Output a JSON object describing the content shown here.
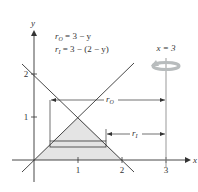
{
  "diagram": {
    "type": "solid-of-revolution",
    "axes": {
      "x_label": "x",
      "y_label": "y",
      "x_ticks": [
        "1",
        "2",
        "3"
      ],
      "y_ticks": [
        "1",
        "2"
      ]
    },
    "equations": {
      "outer": {
        "var": "r",
        "sub": "O",
        "rhs": " = 3 − y"
      },
      "inner": {
        "var": "r",
        "sub": "I",
        "rhs": " = 3 − (2 − y)"
      }
    },
    "axis_of_revolution": {
      "label": "x = 3"
    },
    "dimension_labels": {
      "outer": {
        "var": "r",
        "sub": "O"
      },
      "inner": {
        "var": "r",
        "sub": "I"
      }
    },
    "colors": {
      "region_fill": "#e4e4e4",
      "line": "#333333",
      "axis_of_rotation": "#999999",
      "rotation_arrow": "#b8bcbd"
    }
  }
}
